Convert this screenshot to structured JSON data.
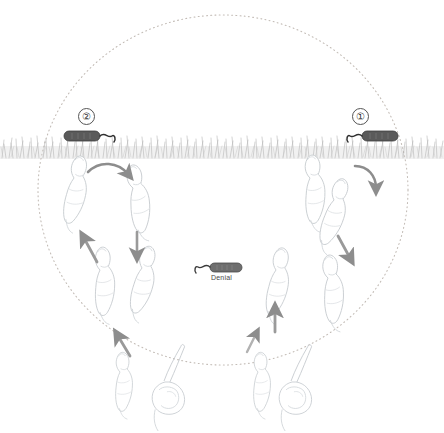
{
  "figure": {
    "title": "",
    "background_color": "#ffffff",
    "width": 444,
    "height": 433
  },
  "colors": {
    "capsule_fill": "#5a5a5a",
    "capsule_stroke": "#3d3d3d",
    "arrow_gray": "#8d8d8d",
    "arrow_dark_gray": "#7a7a7a",
    "outline_gray": "#c9cdd2",
    "grass_gray": "#a8a8a8",
    "dotted_circle": "#c0b9b4",
    "text_color": "#3c3c3c"
  },
  "boundary": {
    "name": "dotted-circle",
    "style": "dotted",
    "cx": 223,
    "cy": 190,
    "rx": 185,
    "ry": 175
  },
  "substrate": {
    "name": "grass-band",
    "description": "horizontal grass / vegetation band",
    "y": 135,
    "height": 24
  },
  "markers": [
    {
      "id": "marker-2",
      "label": "②",
      "plain_label": "2",
      "x": 85,
      "y": 111,
      "capsule_x": 64,
      "capsule_y": 131,
      "tail_direction": "right"
    },
    {
      "id": "marker-1",
      "label": "①",
      "plain_label": "1",
      "x": 356,
      "y": 111,
      "capsule_x": 362,
      "capsule_y": 131,
      "tail_direction": "left"
    }
  ],
  "center_object": {
    "name": "denial-capsule",
    "caption": "Denial",
    "x": 195,
    "y": 263,
    "caption_x": 214,
    "caption_y": 275
  },
  "organisms": {
    "description": "faint outlined worm-like organisms arranged in two mirrored cycles",
    "outline_only": true,
    "left_cycle": [
      {
        "x": 72,
        "y": 175,
        "rot": 8
      },
      {
        "x": 128,
        "y": 185,
        "rot": -14
      },
      {
        "x": 138,
        "y": 265,
        "rot": 10
      },
      {
        "x": 96,
        "y": 268,
        "rot": -6
      }
    ],
    "right_cycle": [
      {
        "x": 308,
        "y": 175,
        "rot": -8
      },
      {
        "x": 330,
        "y": 197,
        "rot": 14
      },
      {
        "x": 324,
        "y": 275,
        "rot": -10
      },
      {
        "x": 272,
        "y": 268,
        "rot": 6
      }
    ],
    "bottom_pairs": [
      {
        "x": 148,
        "y": 360,
        "type": "mating-pair"
      },
      {
        "x": 258,
        "y": 360,
        "type": "mating-pair"
      }
    ]
  },
  "arrows": [
    {
      "name": "arrow-curved-left-top",
      "type": "curved",
      "direction": "down-right"
    },
    {
      "name": "arrow-down-left",
      "type": "straight",
      "direction": "down"
    },
    {
      "name": "arrow-up-left",
      "type": "straight",
      "direction": "up-left"
    },
    {
      "name": "arrow-curved-right-top",
      "type": "curved",
      "direction": "down-right"
    },
    {
      "name": "arrow-down-right",
      "type": "straight",
      "direction": "down-right"
    },
    {
      "name": "arrow-up-right",
      "type": "straight",
      "direction": "up"
    },
    {
      "name": "arrow-up-bottom-left",
      "type": "straight",
      "direction": "up-left"
    },
    {
      "name": "arrow-up-bottom-right",
      "type": "straight",
      "direction": "up-right"
    }
  ]
}
